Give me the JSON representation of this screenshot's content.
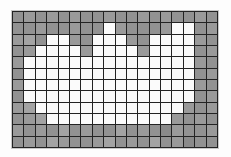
{
  "figure": {
    "kind": "pixel-grid",
    "columns": 18,
    "rows": 12,
    "cell_size_px": 11,
    "gap_px": 1
  },
  "palette": {
    "background": "#fdfdfd",
    "grid_line": "#232323",
    "frame": "#c9c9c9",
    "foreground_on": "#fbfbfb",
    "foreground_off": "#8a8a8a",
    "off_variants": [
      "#8a8a8a",
      "#929292",
      "#9a9a9a",
      "#a3a3a3"
    ]
  },
  "legend": {
    "on_label": "white / set",
    "off_label": "grey / unset"
  },
  "grid": {
    "cells": [
      [
        0,
        0,
        0,
        0,
        0,
        0,
        0,
        0,
        0,
        0,
        0,
        0,
        0,
        0,
        0,
        0,
        0,
        0
      ],
      [
        0,
        0,
        0,
        0,
        0,
        0,
        0,
        0,
        1,
        0,
        0,
        0,
        0,
        0,
        1,
        1,
        0,
        0
      ],
      [
        0,
        0,
        0,
        1,
        1,
        0,
        0,
        1,
        1,
        1,
        0,
        0,
        1,
        1,
        1,
        1,
        0,
        0
      ],
      [
        0,
        0,
        1,
        1,
        1,
        1,
        0,
        1,
        1,
        1,
        1,
        0,
        1,
        1,
        1,
        1,
        0,
        0
      ],
      [
        0,
        1,
        1,
        1,
        1,
        1,
        1,
        1,
        1,
        1,
        1,
        1,
        1,
        1,
        1,
        1,
        0,
        0
      ],
      [
        0,
        1,
        1,
        1,
        1,
        1,
        1,
        1,
        1,
        1,
        1,
        1,
        1,
        1,
        1,
        1,
        0,
        0
      ],
      [
        0,
        1,
        1,
        1,
        1,
        1,
        1,
        1,
        1,
        1,
        1,
        1,
        1,
        1,
        1,
        1,
        0,
        0
      ],
      [
        0,
        1,
        1,
        1,
        1,
        1,
        1,
        1,
        1,
        1,
        1,
        1,
        1,
        1,
        1,
        1,
        0,
        0
      ],
      [
        0,
        0,
        1,
        1,
        1,
        1,
        1,
        1,
        1,
        1,
        1,
        1,
        1,
        1,
        1,
        0,
        0,
        0
      ],
      [
        0,
        0,
        0,
        1,
        1,
        1,
        1,
        1,
        1,
        1,
        1,
        1,
        1,
        1,
        0,
        0,
        0,
        0
      ],
      [
        0,
        0,
        0,
        0,
        0,
        0,
        0,
        0,
        0,
        0,
        0,
        0,
        0,
        0,
        0,
        0,
        0,
        0
      ],
      [
        0,
        0,
        0,
        0,
        0,
        0,
        0,
        0,
        0,
        0,
        0,
        0,
        0,
        0,
        0,
        0,
        0,
        0
      ]
    ],
    "shade": [
      [
        1,
        2,
        1,
        2,
        1,
        2,
        1,
        1,
        2,
        1,
        1,
        2,
        1,
        2,
        1,
        1,
        2,
        1
      ],
      [
        1,
        1,
        2,
        1,
        1,
        2,
        1,
        1,
        0,
        2,
        1,
        1,
        1,
        2,
        0,
        0,
        1,
        2
      ],
      [
        2,
        3,
        1,
        0,
        0,
        2,
        1,
        0,
        0,
        0,
        2,
        1,
        0,
        0,
        0,
        0,
        2,
        1
      ],
      [
        1,
        2,
        0,
        0,
        0,
        0,
        2,
        0,
        0,
        0,
        0,
        2,
        0,
        0,
        0,
        0,
        1,
        2
      ],
      [
        2,
        0,
        0,
        0,
        0,
        0,
        0,
        0,
        0,
        0,
        0,
        0,
        0,
        0,
        0,
        0,
        2,
        1
      ],
      [
        1,
        0,
        0,
        0,
        0,
        0,
        0,
        0,
        0,
        0,
        0,
        0,
        0,
        0,
        0,
        0,
        1,
        2
      ],
      [
        2,
        0,
        0,
        0,
        0,
        0,
        0,
        0,
        0,
        0,
        0,
        0,
        0,
        0,
        0,
        0,
        2,
        1
      ],
      [
        1,
        0,
        0,
        0,
        0,
        0,
        0,
        0,
        0,
        0,
        0,
        0,
        0,
        0,
        0,
        0,
        1,
        2
      ],
      [
        2,
        3,
        0,
        0,
        0,
        0,
        0,
        0,
        0,
        0,
        0,
        0,
        0,
        0,
        0,
        2,
        1,
        2
      ],
      [
        1,
        2,
        3,
        0,
        0,
        0,
        0,
        0,
        0,
        0,
        0,
        0,
        0,
        0,
        2,
        1,
        2,
        1
      ],
      [
        2,
        1,
        2,
        1,
        3,
        1,
        2,
        1,
        1,
        3,
        1,
        2,
        1,
        4,
        2,
        1,
        1,
        2
      ],
      [
        1,
        2,
        1,
        3,
        2,
        1,
        1,
        2,
        3,
        1,
        2,
        1,
        3,
        1,
        2,
        4,
        1,
        1
      ]
    ]
  }
}
